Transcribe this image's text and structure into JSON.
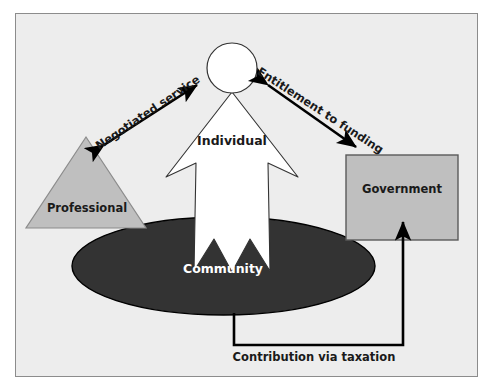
{
  "diagram": {
    "background_color": "#ededed",
    "frame_border_color": "#8c8c8c",
    "nodes": [
      {
        "id": "individual",
        "label": "Individual",
        "shape": "person-figure",
        "fill": "#ffffff",
        "stroke": "#333333",
        "text_color": "#1a1a1a"
      },
      {
        "id": "community",
        "label": "Community",
        "shape": "ellipse",
        "fill": "#333333",
        "stroke": "#000000",
        "text_color": "#ffffff"
      },
      {
        "id": "professional",
        "label": "Professional",
        "shape": "triangle",
        "fill": "#bfbfbf",
        "stroke": "#8c8c8c",
        "text_color": "#1a1a1a"
      },
      {
        "id": "government",
        "label": "Government",
        "shape": "rectangle",
        "fill": "#bfbfbf",
        "stroke": "#5a5a5a",
        "text_color": "#1a1a1a"
      }
    ],
    "connectors": [
      {
        "id": "negotiated-service",
        "label": "Negotiated service",
        "from": "professional",
        "to": "individual",
        "style": "double-headed-arrow",
        "color": "#000000",
        "label_rotation_deg": -34
      },
      {
        "id": "entitlement-to-funding",
        "label": "Entitlement to funding",
        "from": "individual",
        "to": "government",
        "style": "double-headed-arrow",
        "color": "#000000",
        "label_rotation_deg": 33
      },
      {
        "id": "contribution-via-taxation",
        "label": "Contribution via taxation",
        "from": "community",
        "to": "government",
        "style": "elbow-arrow",
        "color": "#000000",
        "label_rotation_deg": 0
      }
    ]
  }
}
